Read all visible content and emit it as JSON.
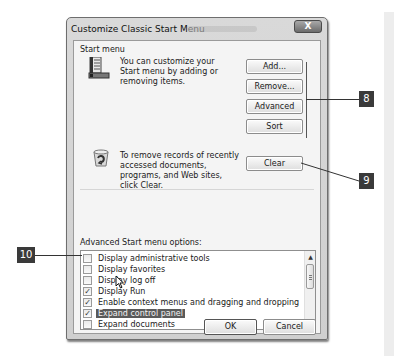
{
  "window": {
    "title": "Customize Classic Start Menu",
    "close_label": "X"
  },
  "start_menu_group": {
    "label": "Start menu",
    "description": "You can customize your Start menu by adding or removing items.",
    "icon": "start-menu-icon",
    "buttons": {
      "add": "Add...",
      "remove": "Remove...",
      "advanced": "Advanced",
      "sort": "Sort"
    }
  },
  "clear_group": {
    "description": "To remove records of recently accessed documents, programs, and Web sites, click Clear.",
    "icon": "recycle-bin-icon",
    "clear_label": "Clear"
  },
  "advanced_options": {
    "label": "Advanced Start menu options:",
    "items": [
      {
        "label": "Display administrative tools",
        "checked": false,
        "selected": false
      },
      {
        "label": "Display favorites",
        "checked": false,
        "selected": false
      },
      {
        "label": "Display log off",
        "checked": false,
        "selected": false
      },
      {
        "label": "Display Run",
        "checked": true,
        "selected": false
      },
      {
        "label": "Enable context menus and dragging and dropping",
        "checked": true,
        "selected": false
      },
      {
        "label": "Expand control panel",
        "checked": true,
        "selected": true
      },
      {
        "label": "Expand documents",
        "checked": false,
        "selected": false
      }
    ],
    "check_glyph": "✓"
  },
  "dialog_buttons": {
    "ok": "OK",
    "cancel": "Cancel"
  },
  "callouts": {
    "c8": "8",
    "c9": "9",
    "c10": "10"
  }
}
